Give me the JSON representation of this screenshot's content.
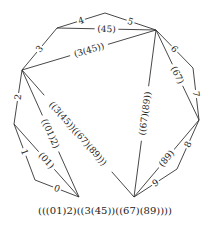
{
  "diagram": {
    "type": "polygon-triangulation",
    "vertices": {
      "A": [
        57,
        28
      ],
      "B": [
        105,
        13
      ],
      "C": [
        156,
        30
      ],
      "D": [
        193,
        68
      ],
      "E": [
        199,
        120
      ],
      "F": [
        177,
        169
      ],
      "G": [
        134,
        197
      ],
      "H": [
        79,
        197
      ],
      "I": [
        35,
        180
      ],
      "J": [
        14,
        124
      ],
      "K": [
        22,
        70
      ]
    },
    "sides": [
      {
        "from": "H",
        "to": "I",
        "label": "0"
      },
      {
        "from": "I",
        "to": "J",
        "label": "1"
      },
      {
        "from": "J",
        "to": "K",
        "label": "2"
      },
      {
        "from": "K",
        "to": "A",
        "label": "3"
      },
      {
        "from": "A",
        "to": "B",
        "label": "4"
      },
      {
        "from": "B",
        "to": "C",
        "label": "5"
      },
      {
        "from": "C",
        "to": "D",
        "label": "6"
      },
      {
        "from": "D",
        "to": "E",
        "label": "7"
      },
      {
        "from": "E",
        "to": "F",
        "label": "8"
      },
      {
        "from": "F",
        "to": "G",
        "label": "9"
      }
    ],
    "diagonals": [
      {
        "from": "A",
        "to": "C",
        "label": "(45)"
      },
      {
        "from": "K",
        "to": "C",
        "label": "(3(45))"
      },
      {
        "from": "C",
        "to": "E",
        "label": "(67)"
      },
      {
        "from": "C",
        "to": "G",
        "label": "((67)(89))"
      },
      {
        "from": "E",
        "to": "G",
        "label": "(89)"
      },
      {
        "from": "K",
        "to": "H",
        "label": "((01)2)"
      },
      {
        "from": "J",
        "to": "H",
        "label": "(01)"
      },
      {
        "from": "K",
        "to": "G",
        "label": "((3(45))((67)(89)))"
      }
    ],
    "caption": "(((01)2)((3(45))((67)(89))))"
  }
}
